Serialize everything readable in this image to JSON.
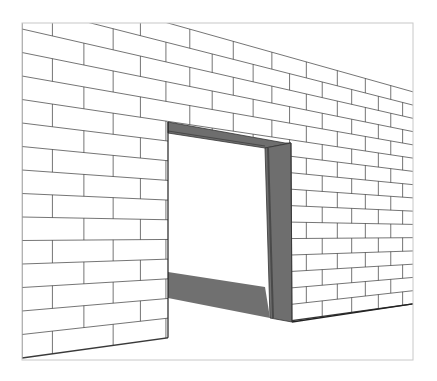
{
  "canvas": {
    "width": 437,
    "height": 381,
    "background": "#ffffff"
  },
  "scene": {
    "subject": "brick wall with open doorway, perspective line drawing",
    "frame": {
      "left": 22,
      "top": 23,
      "right": 413,
      "bottom": 360,
      "stroke": "#c8c8c8"
    },
    "vanishing_point": {
      "x": 919,
      "y": 234
    },
    "wall": {
      "left_edge_x": 22,
      "bottom_left_y": 358,
      "course_height_at_left": 23.5,
      "course_count": 16,
      "brick_length_u": 0.078,
      "depth_scale": 1.0,
      "line_color": "#3a3a3a",
      "face_color": "#ffffff"
    },
    "doorway": {
      "left_x": 168,
      "right_inner_x": 265,
      "right_outer_x": 291,
      "opening_color": "#ffffff",
      "reveal_color": "#6e6e6e",
      "reveal_dark": "#4a4a4a",
      "shadow_color": "#707070",
      "lintel": {
        "outer_left": [
          168,
          122
        ],
        "outer_right": [
          285,
          143
        ],
        "inner_left": [
          168,
          133
        ],
        "inner_right": [
          265,
          148
        ]
      },
      "jamb": {
        "top_inner": [
          265,
          148
        ],
        "top_outer": [
          291,
          143
        ],
        "bottom_inner": [
          270,
          318
        ],
        "bottom_outer": [
          292,
          322
        ]
      },
      "floor_shadow": {
        "top_left": [
          168,
          272
        ],
        "bottom_left": [
          168,
          298
        ],
        "top_right": [
          265,
          287
        ],
        "bottom_right": [
          270,
          318
        ]
      }
    }
  }
}
